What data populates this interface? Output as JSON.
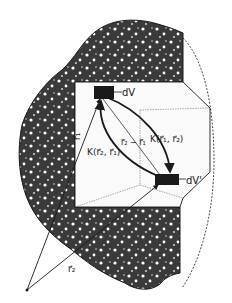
{
  "figure": {
    "labels": {
      "volume_element_1": "dV",
      "volume_element_2": "dV'",
      "position_vector_1": "r⃗₁",
      "position_vector_2": "r⃗₂",
      "difference_vector": "r⃗₂ − r⃗₁",
      "kernel_forward": "K(r⃗₁, r⃗₂)",
      "kernel_backward": "K(r⃗₂, r⃗₁)"
    },
    "colors": {
      "ink": "#1a1a1a",
      "medium_fill": "#3a3a3a",
      "speckle": "#ffffff",
      "background": "#ffffff"
    }
  }
}
